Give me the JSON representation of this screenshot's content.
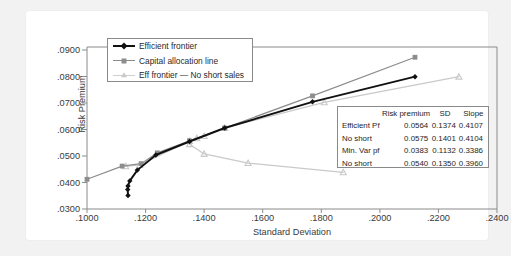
{
  "chart_data": {
    "type": "line",
    "title": "",
    "xlabel": "Standard Deviation",
    "ylabel": "Risk Premium",
    "xlim": [
      0.1,
      0.24
    ],
    "ylim": [
      0.03,
      0.09
    ],
    "xticks": [
      ".1000",
      ".1200",
      ".1400",
      ".1600",
      ".1800",
      ".2000",
      ".2200",
      ".2400"
    ],
    "yticks": [
      ".0300",
      ".0400",
      ".0500",
      ".0600",
      ".0700",
      ".0800",
      ".0900"
    ],
    "grid": false,
    "legend_position": "top-left",
    "series": [
      {
        "name": "Efficient frontier",
        "color": "#111111",
        "marker": "diamond",
        "points": [
          [
            0.114,
            0.035
          ],
          [
            0.1139,
            0.0372
          ],
          [
            0.114,
            0.0385
          ],
          [
            0.1146,
            0.0404
          ],
          [
            0.1172,
            0.0444
          ],
          [
            0.1235,
            0.05
          ],
          [
            0.135,
            0.055
          ],
          [
            0.147,
            0.06
          ],
          [
            0.177,
            0.0697
          ],
          [
            0.212,
            0.079
          ]
        ]
      },
      {
        "name": "Capital allocation line",
        "color": "#8d8d8d",
        "marker": "square",
        "points": [
          [
            0.1,
            0.041
          ],
          [
            0.112,
            0.0459
          ],
          [
            0.1185,
            0.0468
          ],
          [
            0.124,
            0.0508
          ],
          [
            0.135,
            0.0553
          ],
          [
            0.147,
            0.06
          ],
          [
            0.177,
            0.0719
          ],
          [
            0.212,
            0.0862
          ]
        ]
      },
      {
        "name": "Eff frontier — No short sales",
        "color": "#c9c9c9",
        "marker": "triangle",
        "points": [
          [
            0.1132,
            0.0458
          ],
          [
            0.118,
            0.0463
          ],
          [
            0.135,
            0.0552
          ],
          [
            0.1375,
            0.0562
          ],
          [
            0.14,
            0.057
          ],
          [
            0.147,
            0.06
          ],
          [
            0.181,
            0.0695
          ],
          [
            0.227,
            0.079
          ]
        ]
      },
      {
        "name": "Eff frontier — No short sales (lower branch)",
        "color": "#c9c9c9",
        "marker": "triangle",
        "points": [
          [
            0.135,
            0.054
          ],
          [
            0.14,
            0.0504
          ],
          [
            0.155,
            0.047
          ],
          [
            0.1875,
            0.0436
          ]
        ]
      }
    ],
    "table": {
      "headers": [
        "",
        "Risk premium",
        "SD",
        "Slope"
      ],
      "rows": [
        [
          "Efficient Pf",
          "0.0564",
          "0.1374",
          "0.4107"
        ],
        [
          "No short",
          "0.0575",
          "0.1401",
          "0.4104"
        ],
        [
          "Min. Var pf",
          "0.0383",
          "0.1132",
          "0.3386"
        ],
        [
          "No short",
          "0.0540",
          "0.1350",
          "0.3960"
        ]
      ]
    }
  },
  "legend": {
    "items": [
      {
        "label": "Efficient frontier"
      },
      {
        "label": "Capital allocation line"
      },
      {
        "label": "Eff frontier — No short sales"
      }
    ]
  }
}
